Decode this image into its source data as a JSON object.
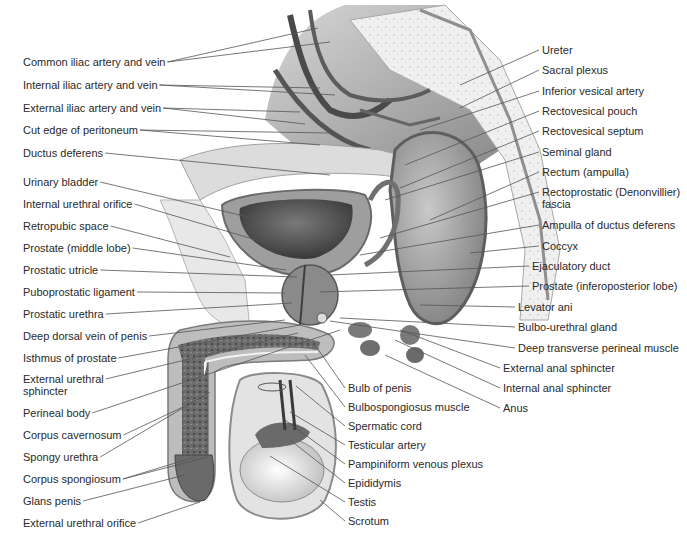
{
  "figure": {
    "palette": {
      "background": "#ffffff",
      "label_text": "#2a2a2a",
      "leader_line": "#555555",
      "tissue_light": "#e6e6e6",
      "tissue_mid": "#b5b5b5",
      "tissue_dark": "#5a5a5a",
      "bone": "#efefef"
    }
  },
  "labels_left": [
    {
      "text": "Common iliac artery and vein",
      "x": 23,
      "y": 66,
      "tx": 318,
      "ty": 28,
      "tx2": 330,
      "ty2": 42
    },
    {
      "text": "Internal iliac artery and vein",
      "x": 23,
      "y": 89,
      "tx": 320,
      "ty": 88,
      "tx2": 335,
      "ty2": 95
    },
    {
      "text": "External iliac artery and vein",
      "x": 23,
      "y": 112,
      "tx": 300,
      "ty": 112,
      "tx2": 305,
      "ty2": 124
    },
    {
      "text": "Cut edge of peritoneum",
      "x": 23,
      "y": 134,
      "tx": 330,
      "ty": 133,
      "tx2": 320,
      "ty2": 145
    },
    {
      "text": "Ductus deferens",
      "x": 23,
      "y": 157,
      "tx": 330,
      "ty": 175
    },
    {
      "text": "Urinary bladder",
      "x": 23,
      "y": 186,
      "tx": 265,
      "ty": 221
    },
    {
      "text": "Internal urethral orifice",
      "x": 23,
      "y": 208,
      "tx": 270,
      "ty": 244
    },
    {
      "text": "Retropubic space",
      "x": 23,
      "y": 230,
      "tx": 230,
      "ty": 257
    },
    {
      "text": "Prostate (middle lobe)",
      "x": 23,
      "y": 252,
      "tx": 286,
      "ty": 270
    },
    {
      "text": "Prostatic utricle",
      "x": 23,
      "y": 274,
      "tx": 297,
      "ty": 277
    },
    {
      "text": "Puboprostatic ligament",
      "x": 23,
      "y": 296,
      "tx": 285,
      "ty": 293
    },
    {
      "text": "Prostatic urethra",
      "x": 23,
      "y": 318,
      "tx": 292,
      "ty": 303
    },
    {
      "text": "Deep dorsal vein of penis",
      "x": 23,
      "y": 340,
      "tx": 285,
      "ty": 320
    },
    {
      "text": "Isthmus of prostate",
      "x": 23,
      "y": 362,
      "tx": 300,
      "ty": 325
    },
    {
      "text": "External urethral\nsphincter",
      "x": 23,
      "y": 383,
      "tx": 298,
      "ty": 333
    },
    {
      "text": "Perineal body",
      "x": 23,
      "y": 417,
      "tx": 340,
      "ty": 330
    },
    {
      "text": "Corpus cavernosum",
      "x": 23,
      "y": 439,
      "tx": 185,
      "ty": 406
    },
    {
      "text": "Spongy urethra",
      "x": 23,
      "y": 461,
      "tx": 210,
      "ty": 392
    },
    {
      "text": "Corpus spongiosum",
      "x": 23,
      "y": 483,
      "tx": 195,
      "ty": 457,
      "tx2": 208,
      "ty2": 457
    },
    {
      "text": "Glans penis",
      "x": 23,
      "y": 505,
      "tx": 185,
      "ty": 475
    },
    {
      "text": "External urethral orifice",
      "x": 23,
      "y": 527,
      "tx": 200,
      "ty": 502
    }
  ],
  "labels_right": [
    {
      "text": "Ureter",
      "x": 542,
      "y": 54,
      "tx": 460,
      "ty": 85
    },
    {
      "text": "Sacral plexus",
      "x": 542,
      "y": 74,
      "tx": 460,
      "ty": 108
    },
    {
      "text": "Inferior vesical artery",
      "x": 542,
      "y": 95,
      "tx": 420,
      "ty": 130
    },
    {
      "text": "Rectovesical pouch",
      "x": 542,
      "y": 115,
      "tx": 405,
      "ty": 165
    },
    {
      "text": "Rectovesical septum",
      "x": 542,
      "y": 135,
      "tx": 400,
      "ty": 188
    },
    {
      "text": "Seminal gland",
      "x": 542,
      "y": 156,
      "tx": 385,
      "ty": 200
    },
    {
      "text": "Rectum (ampulla)",
      "x": 542,
      "y": 176,
      "tx": 430,
      "ty": 220
    },
    {
      "text": "Rectoprostatic (Denonvillier)\nfascia",
      "x": 542,
      "y": 196,
      "tx": 380,
      "ty": 238
    },
    {
      "text": "Ampulla of ductus deferens",
      "x": 542,
      "y": 229,
      "tx": 360,
      "ty": 255
    },
    {
      "text": "Coccyx",
      "x": 542,
      "y": 250,
      "tx": 470,
      "ty": 253
    },
    {
      "text": "Ejaculatory duct",
      "x": 532,
      "y": 270,
      "tx": 330,
      "ty": 275
    },
    {
      "text": "Prostate (inferoposterior lobe)",
      "x": 532,
      "y": 290,
      "tx": 320,
      "ty": 292
    },
    {
      "text": "Levator ani",
      "x": 518,
      "y": 311,
      "tx": 420,
      "ty": 305
    },
    {
      "text": "Bulbo-urethral gland",
      "x": 518,
      "y": 331,
      "tx": 340,
      "ty": 318
    },
    {
      "text": "Deep transverse perineal muscle",
      "x": 518,
      "y": 352,
      "tx": 330,
      "ty": 321
    },
    {
      "text": "External anal sphincter",
      "x": 503,
      "y": 372,
      "tx": 400,
      "ty": 330
    },
    {
      "text": "Internal anal sphincter",
      "x": 503,
      "y": 392,
      "tx": 395,
      "ty": 340
    },
    {
      "text": "Anus",
      "x": 503,
      "y": 412,
      "tx": 385,
      "ty": 355
    },
    {
      "text": "Bulb of penis",
      "x": 348,
      "y": 392,
      "tx": 315,
      "ty": 345
    },
    {
      "text": "Bulbospongiosus muscle",
      "x": 348,
      "y": 411,
      "tx": 305,
      "ty": 355
    },
    {
      "text": "Spermatic cord",
      "x": 348,
      "y": 430,
      "tx": 296,
      "ty": 386
    },
    {
      "text": "Testicular artery",
      "x": 348,
      "y": 449,
      "tx": 290,
      "ty": 412
    },
    {
      "text": "Pampiniform venous plexus",
      "x": 348,
      "y": 468,
      "tx": 285,
      "ty": 420
    },
    {
      "text": "Epididymis",
      "x": 348,
      "y": 487,
      "tx": 290,
      "ty": 440
    },
    {
      "text": "Testis",
      "x": 348,
      "y": 506,
      "tx": 270,
      "ty": 456
    },
    {
      "text": "Scrotum",
      "x": 348,
      "y": 525,
      "tx": 320,
      "ty": 500
    }
  ],
  "caption": {
    "visible": "cut off at bottom edge (illegible)"
  }
}
